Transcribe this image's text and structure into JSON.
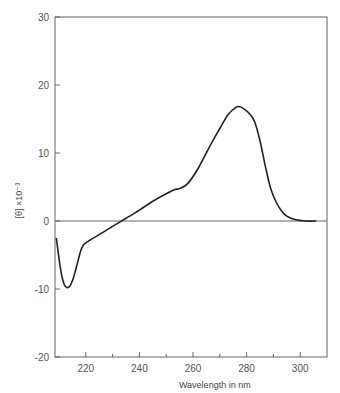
{
  "chart_data": {
    "type": "line",
    "title": "",
    "xlabel": "Wavelength in nm",
    "ylabel": "[θ] ×10⁻³",
    "xlim": [
      208.5,
      310
    ],
    "ylim": [
      -20,
      30
    ],
    "x_ticks": [
      220,
      240,
      260,
      280,
      300
    ],
    "x_minor_ticks": [
      230,
      250,
      270,
      290
    ],
    "y_ticks": [
      -20,
      -10,
      0,
      10,
      20,
      30
    ],
    "grid": false,
    "zero_line": true,
    "series": [
      {
        "name": "CD spectrum",
        "x": [
          209,
          210,
          211,
          212,
          213,
          214,
          215,
          216,
          217,
          218,
          219,
          220,
          225,
          230,
          235,
          240,
          245,
          250,
          253,
          255,
          258,
          262,
          266,
          270,
          273,
          276,
          277.5,
          279,
          281,
          283,
          285,
          287,
          289,
          291,
          293,
          295,
          298,
          302,
          306
        ],
        "values": [
          -2.5,
          -5.5,
          -8.0,
          -9.4,
          -9.8,
          -9.6,
          -8.8,
          -7.5,
          -6.0,
          -4.5,
          -3.6,
          -3.2,
          -2.0,
          -0.8,
          0.4,
          1.6,
          2.9,
          4.0,
          4.6,
          4.8,
          5.5,
          7.8,
          10.8,
          13.6,
          15.6,
          16.7,
          16.8,
          16.5,
          15.8,
          14.6,
          11.8,
          8.0,
          4.8,
          2.8,
          1.5,
          0.7,
          0.2,
          0.0,
          0.0
        ]
      }
    ]
  },
  "axes": {
    "x_tick_labels": [
      "220",
      "240",
      "260",
      "280",
      "300"
    ],
    "y_tick_labels": [
      "30",
      "20",
      "10",
      "0",
      "-10",
      "-20"
    ],
    "xlabel": "Wavelength in nm",
    "ylabel": "[θ] ×10⁻³"
  },
  "style": {
    "line_color": "#222222",
    "axis_color": "#666666"
  }
}
